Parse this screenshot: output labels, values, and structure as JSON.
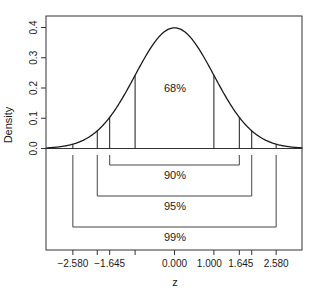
{
  "chart_data": {
    "type": "line",
    "title": "",
    "xlabel": "z",
    "ylabel": "Density",
    "xlim": [
      -3.25,
      3.25
    ],
    "ylim": [
      0,
      0.4
    ],
    "grid": false,
    "legend": null,
    "series": [
      {
        "name": "Standard normal density",
        "function": "dnorm(z)",
        "x_range": [
          -3.25,
          3.25
        ]
      }
    ],
    "y_ticks": [
      {
        "value": 0.0,
        "label": "0.0"
      },
      {
        "value": 0.1,
        "label": "0.1"
      },
      {
        "value": 0.2,
        "label": "0.2"
      },
      {
        "value": 0.3,
        "label": "0.3"
      },
      {
        "value": 0.4,
        "label": "0.4"
      }
    ],
    "x_ticks": [
      {
        "value": -2.58,
        "label": "−2.580"
      },
      {
        "value": -1.96,
        "label": ""
      },
      {
        "value": -1.645,
        "label": "−1.645"
      },
      {
        "value": -1.0,
        "label": ""
      },
      {
        "value": 0.0,
        "label": "0.000"
      },
      {
        "value": 1.0,
        "label": "1.000"
      },
      {
        "value": 1.645,
        "label": "1.645"
      },
      {
        "value": 1.96,
        "label": ""
      },
      {
        "value": 2.58,
        "label": "2.580"
      }
    ],
    "vertical_lines_z": [
      -2.58,
      -1.96,
      -1.645,
      -1.0,
      1.0,
      1.645,
      1.96,
      2.58
    ],
    "intervals": [
      {
        "label": "68%",
        "lower": -1.0,
        "upper": 1.0,
        "placement": "inside-curve"
      },
      {
        "label": "90%",
        "lower": -1.645,
        "upper": 1.645,
        "placement": "bracket-1"
      },
      {
        "label": "95%",
        "lower": -1.96,
        "upper": 1.96,
        "placement": "bracket-2"
      },
      {
        "label": "99%",
        "lower": -2.58,
        "upper": 2.58,
        "placement": "bracket-3"
      }
    ]
  },
  "colors": {
    "curve": "#1a1a1a",
    "axis": "#333333",
    "bracket": "#444444"
  }
}
